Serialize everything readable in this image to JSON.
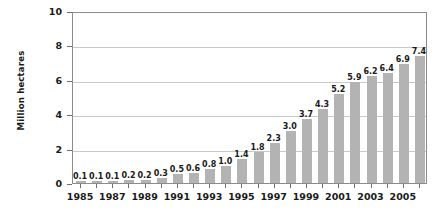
{
  "chart_data": {
    "type": "bar",
    "title": "",
    "subtitle": "",
    "xlabel": "",
    "ylabel": "Million hectares",
    "ylim": [
      0,
      10
    ],
    "yticks": [
      0,
      2,
      4,
      6,
      8,
      10
    ],
    "ytick_labels": [
      "0",
      "2",
      "4",
      "6",
      "8",
      "10"
    ],
    "grid": true,
    "legend": null,
    "legend_position": "none",
    "bar_color": "#b3b3b3",
    "axis_color": "#8c8c8c",
    "gridline_color": "#c9c9c9",
    "text_color": "#1a1a1a",
    "categories": [
      "1985",
      "1986",
      "1987",
      "1988",
      "1989",
      "1990",
      "1991",
      "1992",
      "1993",
      "1994",
      "1995",
      "1996",
      "1997",
      "1998",
      "1999",
      "2000",
      "2001",
      "2002",
      "2003",
      "2004",
      "2005",
      "2006"
    ],
    "values": [
      0.1,
      0.1,
      0.1,
      0.2,
      0.2,
      0.3,
      0.5,
      0.6,
      0.8,
      1.0,
      1.4,
      1.8,
      2.3,
      3.0,
      3.7,
      4.3,
      5.2,
      5.9,
      6.2,
      6.4,
      6.9,
      7.4
    ],
    "data_labels": [
      "0.1",
      "0.1",
      "0.1",
      "0.2",
      "0.2",
      "0.3",
      "0.5",
      "0.6",
      "0.8",
      "1.0",
      "1.4",
      "1.8",
      "2.3",
      "3.0",
      "3.7",
      "4.3",
      "5.2",
      "5.9",
      "6.2",
      "6.4",
      "6.9",
      "7.4"
    ],
    "xtick_labels_shown": [
      "1985",
      "1987",
      "1989",
      "1991",
      "1993",
      "1995",
      "1997",
      "1999",
      "2001",
      "2003",
      "2005"
    ],
    "xtick_label_indices": [
      0,
      2,
      4,
      6,
      8,
      10,
      12,
      14,
      16,
      18,
      20
    ]
  }
}
